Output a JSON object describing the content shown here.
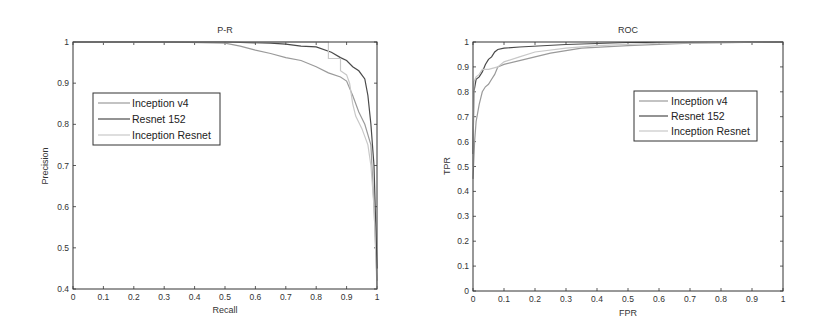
{
  "chart_data": [
    {
      "type": "line",
      "title": "P-R",
      "xlabel": "Recall",
      "ylabel": "Precision",
      "xlim": [
        0,
        1
      ],
      "ylim": [
        0.4,
        1
      ],
      "xticks": [
        "0",
        "0.1",
        "0.2",
        "0.3",
        "0.4",
        "0.5",
        "0.6",
        "0.7",
        "0.8",
        "0.9",
        "1"
      ],
      "yticks": [
        "0.4",
        "0.5",
        "0.6",
        "0.7",
        "0.8",
        "0.9",
        "1"
      ],
      "grid": false,
      "legend_position": "upper-left (inside)",
      "series": [
        {
          "name": "Inception v4",
          "color": "#9a9a9a",
          "x": [
            0,
            0.3,
            0.5,
            0.55,
            0.6,
            0.65,
            0.7,
            0.75,
            0.8,
            0.84,
            0.88,
            0.9,
            0.92,
            0.94,
            0.96,
            0.98,
            0.99,
            1.0
          ],
          "y": [
            1.0,
            1.0,
            0.997,
            0.99,
            0.98,
            0.972,
            0.962,
            0.955,
            0.94,
            0.925,
            0.915,
            0.905,
            0.87,
            0.83,
            0.8,
            0.75,
            0.6,
            0.42
          ]
        },
        {
          "name": "Resnet 152",
          "color": "#4a4a4a",
          "x": [
            0,
            0.5,
            0.65,
            0.7,
            0.75,
            0.8,
            0.85,
            0.88,
            0.9,
            0.92,
            0.94,
            0.96,
            0.97,
            0.98,
            0.99,
            1.0
          ],
          "y": [
            1.0,
            1.0,
            0.997,
            0.995,
            0.99,
            0.988,
            0.975,
            0.962,
            0.955,
            0.94,
            0.93,
            0.91,
            0.87,
            0.8,
            0.7,
            0.45
          ]
        },
        {
          "name": "Inception Resnet",
          "color": "#c8c8c8",
          "x": [
            0,
            0.5,
            0.7,
            0.8,
            0.84,
            0.84,
            0.88,
            0.88,
            0.9,
            0.91,
            0.92,
            0.93,
            0.95,
            0.97,
            0.98,
            0.99,
            1.0
          ],
          "y": [
            1.0,
            1.0,
            1.0,
            1.0,
            1.0,
            0.96,
            0.96,
            0.93,
            0.92,
            0.9,
            0.85,
            0.82,
            0.79,
            0.75,
            0.7,
            0.6,
            0.4
          ]
        }
      ]
    },
    {
      "type": "line",
      "title": "ROC",
      "xlabel": "FPR",
      "ylabel": "TPR",
      "xlim": [
        0,
        1
      ],
      "ylim": [
        0,
        1
      ],
      "xticks": [
        "0",
        "0.1",
        "0.2",
        "0.3",
        "0.4",
        "0.5",
        "0.6",
        "0.7",
        "0.8",
        "0.9",
        "1"
      ],
      "yticks": [
        "0",
        "0.1",
        "0.2",
        "0.3",
        "0.4",
        "0.5",
        "0.6",
        "0.7",
        "0.8",
        "0.9",
        "1"
      ],
      "grid": false,
      "legend_position": "upper-right (inside)",
      "series": [
        {
          "name": "Inception v4",
          "color": "#9a9a9a",
          "x": [
            0,
            0.005,
            0.01,
            0.02,
            0.03,
            0.04,
            0.05,
            0.06,
            0.07,
            0.08,
            0.1,
            0.15,
            0.2,
            0.25,
            0.3,
            0.35,
            0.5,
            0.7,
            1.0
          ],
          "y": [
            0.45,
            0.6,
            0.68,
            0.75,
            0.8,
            0.82,
            0.83,
            0.85,
            0.87,
            0.9,
            0.91,
            0.925,
            0.94,
            0.955,
            0.965,
            0.975,
            0.985,
            0.995,
            1.0
          ]
        },
        {
          "name": "Resnet 152",
          "color": "#4a4a4a",
          "x": [
            0,
            0.003,
            0.01,
            0.02,
            0.03,
            0.04,
            0.05,
            0.06,
            0.07,
            0.08,
            0.1,
            0.15,
            0.3,
            0.5,
            1.0
          ],
          "y": [
            0.55,
            0.8,
            0.85,
            0.86,
            0.88,
            0.91,
            0.93,
            0.94,
            0.96,
            0.97,
            0.975,
            0.98,
            0.99,
            0.998,
            1.0
          ]
        },
        {
          "name": "Inception Resnet",
          "color": "#c8c8c8",
          "x": [
            0,
            0.003,
            0.01,
            0.02,
            0.03,
            0.05,
            0.08,
            0.1,
            0.15,
            0.2,
            0.3,
            0.4,
            0.6,
            1.0
          ],
          "y": [
            0.5,
            0.84,
            0.86,
            0.87,
            0.89,
            0.89,
            0.9,
            0.92,
            0.94,
            0.96,
            0.975,
            0.985,
            0.995,
            1.0
          ]
        }
      ]
    }
  ],
  "plots": [
    {
      "title": "P-R",
      "xlabel": "Recall",
      "ylabel": "Precision",
      "legend": [
        "Inception v4",
        "Resnet 152",
        "Inception Resnet"
      ]
    },
    {
      "title": "ROC",
      "xlabel": "FPR",
      "ylabel": "TPR",
      "legend": [
        "Inception v4",
        "Resnet 152",
        "Inception Resnet"
      ]
    }
  ]
}
